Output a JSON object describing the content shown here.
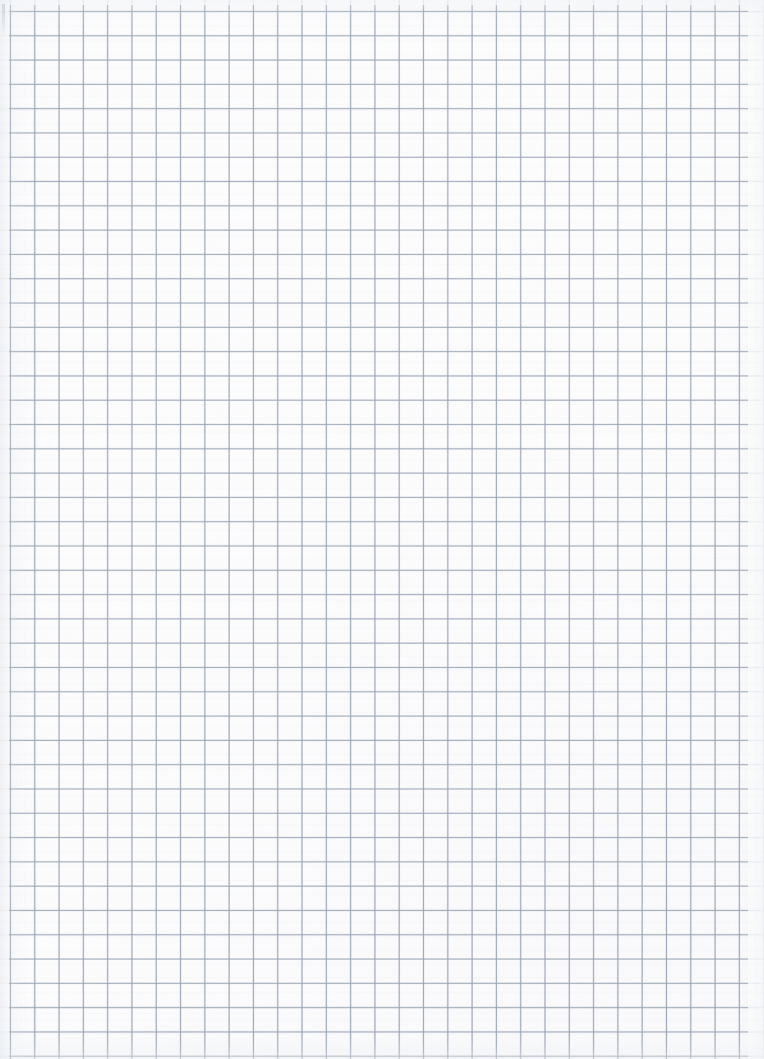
{
  "document": {
    "kind": "scanned-blank-graph-paper",
    "title": "Blank Graph Paper Sheet",
    "caption": "Scanned sheet of blank quadrille graph paper with no writing, drawings or text",
    "page_width_px": 764,
    "page_height_px": 1059,
    "has_text": false,
    "has_handwriting": false,
    "has_figures": false
  },
  "paper": {
    "background_color": "#fcfcfd",
    "margin_color": "#ffffff",
    "left_margin_px": 9,
    "right_margin_px": 16,
    "top_margin_px": 5
  },
  "grid": {
    "style": "quadrille",
    "line_color": "#96a0b0",
    "bleed_color": "#a8b1c0",
    "cell_size_px": 24.3,
    "line_width_px": 1,
    "origin_x_px": 10,
    "origin_y_px": 11,
    "columns": 31,
    "rows": 43,
    "major_minor_distinction": false
  },
  "artifacts": {
    "corner_mark_color": "#b0b6c0",
    "gutter_tint": "#f3f4f7",
    "vignette_tint": "#eceef2"
  }
}
